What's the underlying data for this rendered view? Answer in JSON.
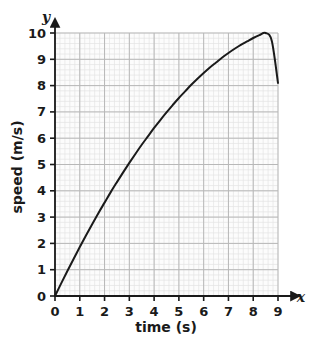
{
  "chart_data": {
    "type": "line",
    "title": "",
    "xlabel": "time (s)",
    "ylabel": "speed (m/s)",
    "x_axis_letter": "x",
    "y_axis_letter": "y",
    "xlim": [
      0,
      9
    ],
    "ylim": [
      0,
      10
    ],
    "xticks": [
      "0",
      "1",
      "2",
      "3",
      "4",
      "5",
      "6",
      "7",
      "8",
      "9"
    ],
    "yticks": [
      "0",
      "1",
      "2",
      "3",
      "4",
      "5",
      "6",
      "7",
      "8",
      "9",
      "10"
    ],
    "xtick_values": [
      0,
      1,
      2,
      3,
      4,
      5,
      6,
      7,
      8,
      9
    ],
    "ytick_values": [
      0,
      1,
      2,
      3,
      4,
      5,
      6,
      7,
      8,
      9,
      10
    ],
    "grid": true,
    "minor_grid": true,
    "minor_grid_subdivisions": 5,
    "legend": false,
    "legend_position": "none",
    "annotations": [],
    "series": [
      {
        "name": "speed",
        "color": "#1a1a1a",
        "line_width": 2,
        "x": [
          0,
          0.25,
          0.5,
          0.75,
          1,
          1.25,
          1.5,
          1.75,
          2,
          2.25,
          2.5,
          2.75,
          3,
          3.25,
          3.5,
          3.75,
          4,
          4.25,
          4.5,
          4.75,
          5,
          5.25,
          5.5,
          5.75,
          6,
          6.25,
          6.5,
          6.75,
          7,
          7.25,
          7.5,
          7.75,
          8,
          8.25,
          8.5,
          8.75,
          9
        ],
        "values": [
          0,
          0.48,
          0.95,
          1.41,
          1.86,
          2.3,
          2.73,
          3.15,
          3.55,
          3.95,
          4.33,
          4.7,
          5.06,
          5.41,
          5.75,
          6.07,
          6.39,
          6.69,
          6.98,
          7.26,
          7.53,
          7.78,
          8.03,
          8.26,
          8.48,
          8.69,
          8.88,
          9.07,
          9.24,
          9.4,
          9.55,
          9.68,
          9.81,
          9.92,
          10.0,
          9.7,
          8.1
        ]
      }
    ],
    "key_points": {
      "start": [
        0,
        0
      ],
      "peak": [
        6.5,
        10
      ],
      "end": [
        9,
        8.1
      ]
    }
  },
  "colors": {
    "axis": "#1a1a1a",
    "curve": "#1a1a1a",
    "major_grid": "#b8b8b8",
    "minor_grid": "#e4e4e4",
    "plot_background": "#fcfcfc",
    "page_background": "#ffffff",
    "text": "#1a1a1a"
  }
}
